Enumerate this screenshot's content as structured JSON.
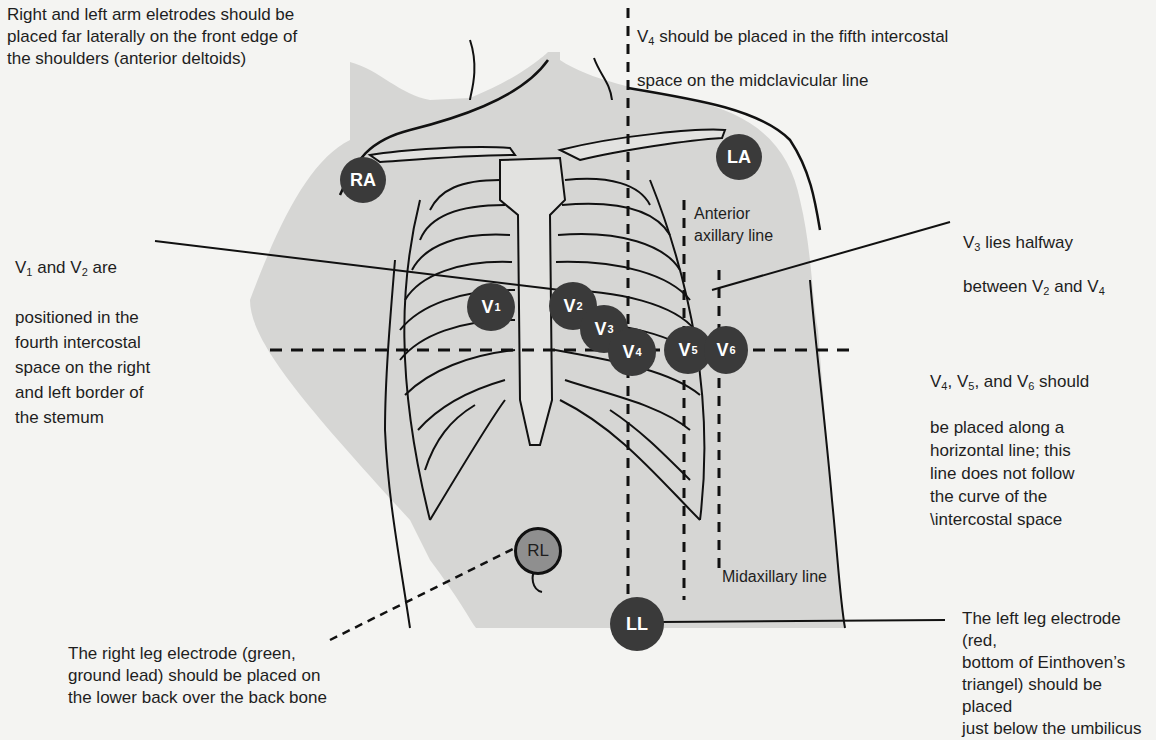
{
  "diagram": {
    "annotations": {
      "arm_electrodes": "Right and left arm eletrodes should be\nplaced far laterally on the front edge of\nthe shoulders (anterior deltoids)",
      "v4_placement_pre": "V",
      "v4_placement_sub": "4",
      "v4_placement_line1": " should be placed in the fifth intercostal",
      "v4_placement_line2": "space on the midclavicular line",
      "v1v2_pre": "V",
      "v1v2_sub1": "1",
      "v1v2_mid": " and V",
      "v1v2_sub2": "2",
      "v1v2_post": " are",
      "v1v2_rest": "positioned in the\nfourth intercostal\nspace on the right\nand left border of\nthe stemum",
      "v3_pre": "V",
      "v3_sub": "3",
      "v3_post": " lies halfway",
      "v3_line2_pre": "between V",
      "v3_line2_sub1": "2",
      "v3_line2_mid": " and V",
      "v3_line2_sub2": "4",
      "v456_p1": "V",
      "v456_s1": "4",
      "v456_p2": ", V",
      "v456_s2": "5",
      "v456_p3": ", and V",
      "v456_s3": "6",
      "v456_p4": " should",
      "v456_rest": "be placed along a\nhorizontal line; this\nline does not follow\nthe curve of the\n\\intercostal space",
      "right_leg": "The right leg electrode (green,\nground lead) should be placed on\nthe lower back over the back bone",
      "left_leg": "The left leg electrode (red,\nbottom of Einthoven’s\ntriangel) should be placed\njust below the umbilicus"
    },
    "line_labels": {
      "anterior_axillary": "Anterior\naxillary line",
      "midaxillary": "Midaxillary line"
    },
    "electrodes": {
      "ra": "RA",
      "la": "LA",
      "rl": "RL",
      "ll": "LL",
      "v_letter": "V",
      "v1": "1",
      "v2": "2",
      "v3": "3",
      "v4": "4",
      "v5": "5",
      "v6": "6"
    },
    "colors": {
      "skin": "#d6d6d4",
      "electrode": "#3a3a3a",
      "rl_electrode": "#8f8f8f",
      "outline": "#111111",
      "text": "#1e1e1e"
    }
  }
}
